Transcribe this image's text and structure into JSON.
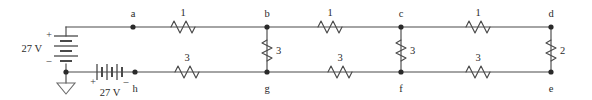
{
  "diagram": {
    "type": "electrical-circuit-schematic",
    "units": {
      "resistance": "ohms",
      "voltage": "V"
    }
  },
  "sources": [
    {
      "id": "battery-left",
      "label": "27 V",
      "orientation": "vertical",
      "plus_sign": "+",
      "minus_sign": "–",
      "plus_position": "top",
      "minus_position": "bottom"
    },
    {
      "id": "battery-bottom",
      "label": "27 V",
      "orientation": "horizontal",
      "plus_sign": "+",
      "minus_sign": "–",
      "plus_position": "left",
      "minus_position": "right"
    }
  ],
  "ground": {
    "id": "ground-symbol",
    "shape": "triangle"
  },
  "nodes": [
    {
      "id": "a",
      "label": "a",
      "x": 133,
      "y": 27,
      "label_x": 133,
      "label_y": 16
    },
    {
      "id": "b",
      "label": "b",
      "x": 267,
      "y": 27,
      "label_x": 267,
      "label_y": 16
    },
    {
      "id": "c",
      "label": "c",
      "x": 401,
      "y": 27,
      "label_x": 401,
      "label_y": 16
    },
    {
      "id": "d",
      "label": "d",
      "x": 551,
      "y": 27,
      "label_x": 551,
      "label_y": 16
    },
    {
      "id": "e",
      "label": "e",
      "x": 551,
      "y": 72,
      "label_x": 551,
      "label_y": 91
    },
    {
      "id": "f",
      "label": "f",
      "x": 401,
      "y": 72,
      "label_x": 401,
      "label_y": 91
    },
    {
      "id": "g",
      "label": "g",
      "x": 267,
      "y": 72,
      "label_x": 267,
      "label_y": 91
    },
    {
      "id": "h",
      "label": "h",
      "x": 135,
      "y": 72,
      "label_x": 135,
      "label_y": 91
    }
  ],
  "resistors": [
    {
      "id": "r-ab",
      "between": "a-b",
      "value": "1",
      "orientation": "horizontal",
      "cx": 183,
      "cy": 27,
      "label_x": 183,
      "label_y": 16
    },
    {
      "id": "r-bc",
      "between": "b-c",
      "value": "1",
      "orientation": "horizontal",
      "cx": 330,
      "cy": 27,
      "label_x": 330,
      "label_y": 16
    },
    {
      "id": "r-cd",
      "between": "c-d",
      "value": "1",
      "orientation": "horizontal",
      "cx": 478,
      "cy": 27,
      "label_x": 478,
      "label_y": 16
    },
    {
      "id": "r-hg",
      "between": "h-g",
      "value": "3",
      "orientation": "horizontal",
      "cx": 187,
      "cy": 72,
      "label_x": 187,
      "label_y": 61
    },
    {
      "id": "r-gf",
      "between": "g-f",
      "value": "3",
      "orientation": "horizontal",
      "cx": 340,
      "cy": 72,
      "label_x": 340,
      "label_y": 61
    },
    {
      "id": "r-fe",
      "between": "f-e",
      "value": "3",
      "orientation": "horizontal",
      "cx": 478,
      "cy": 72,
      "label_x": 478,
      "label_y": 61
    },
    {
      "id": "r-bg",
      "between": "b-g",
      "value": "3",
      "orientation": "vertical",
      "cx": 267,
      "cy": 50,
      "label_x": 279,
      "label_y": 53
    },
    {
      "id": "r-cf",
      "between": "c-f",
      "value": "3",
      "orientation": "vertical",
      "cx": 401,
      "cy": 50,
      "label_x": 413,
      "label_y": 53
    },
    {
      "id": "r-de",
      "between": "d-e",
      "value": "2",
      "orientation": "vertical",
      "cx": 551,
      "cy": 50,
      "label_x": 563,
      "label_y": 53
    }
  ],
  "labels": {
    "battery_left_value": "27 V",
    "battery_bottom_value": "27 V",
    "plus": "+",
    "minus": "–"
  }
}
